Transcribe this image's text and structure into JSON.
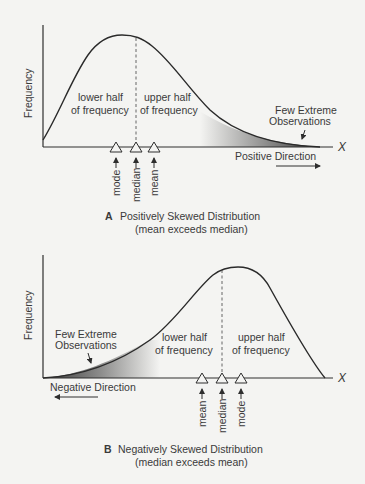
{
  "diagrams": [
    {
      "id": "A",
      "letter": "A",
      "title": "Positively Skewed Distribution",
      "subtitle": "(mean exceeds median)",
      "y_axis_label": "Frequency",
      "x_axis_label": "X",
      "left_region_label": [
        "lower half",
        "of frequency"
      ],
      "right_region_label": [
        "upper half",
        "of frequency"
      ],
      "tail_label": [
        "Few Extreme",
        "Observations"
      ],
      "direction_label": "Positive Direction",
      "markers": [
        {
          "label": "mode",
          "x": 116
        },
        {
          "label": "median",
          "x": 136
        },
        {
          "label": "mean",
          "x": 154
        }
      ]
    },
    {
      "id": "B",
      "letter": "B",
      "title": "Negatively Skewed Distribution",
      "subtitle": "(median exceeds mean)",
      "y_axis_label": "Frequency",
      "x_axis_label": "X",
      "left_region_label": [
        "lower half",
        "of frequency"
      ],
      "right_region_label": [
        "upper half",
        "of frequency"
      ],
      "tail_label": [
        "Few Extreme",
        "Observations"
      ],
      "direction_label": "Negative Direction",
      "markers": [
        {
          "label": "mean",
          "x": 202
        },
        {
          "label": "median",
          "x": 222
        },
        {
          "label": "mode",
          "x": 241
        }
      ]
    }
  ],
  "colors": {
    "background": "#f4f4f2",
    "ink": "#2e2e2e",
    "tail_shade_dark": "#3a3a3a"
  }
}
